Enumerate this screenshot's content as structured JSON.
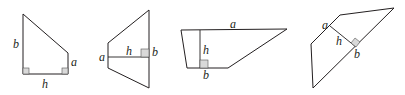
{
  "figures": [
    {
      "id": "fig1",
      "shape": "right trapezoid",
      "labels": {
        "b": "b",
        "a": "a",
        "h": "h"
      }
    },
    {
      "id": "fig2",
      "shape": "trapezoid with vertical parallel sides",
      "labels": {
        "a": "a",
        "h": "h",
        "b": "b"
      }
    },
    {
      "id": "fig3",
      "shape": "trapezoid with horizontal parallel sides",
      "labels": {
        "a": "a",
        "h": "h",
        "b": "b"
      }
    },
    {
      "id": "fig4",
      "shape": "rotated trapezoid",
      "labels": {
        "a": "a",
        "h": "h",
        "b": "b"
      }
    }
  ],
  "colors": {
    "stroke": "#231f20",
    "right_angle_fill": "#d9d9d9"
  }
}
